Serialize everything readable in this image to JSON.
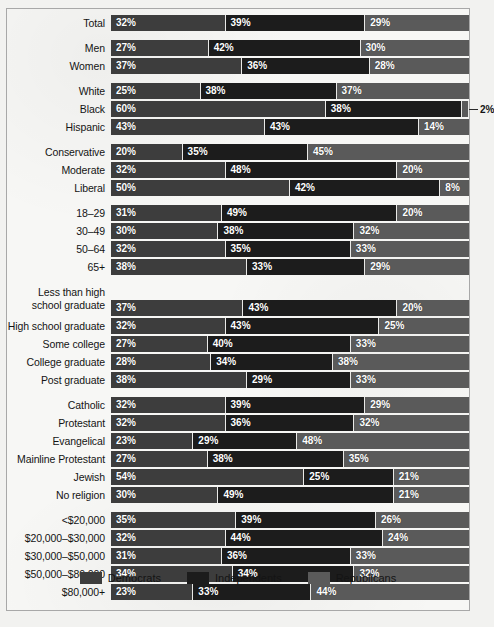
{
  "chart_data": {
    "type": "bar",
    "title": "",
    "subtitle": "",
    "xlabel": "",
    "ylabel": "",
    "orientation": "horizontal",
    "stacked": true,
    "normalized_percent": true,
    "xlim": [
      0,
      100
    ],
    "grid": false,
    "legend_position": "bottom",
    "series": [
      {
        "name": "Democrats",
        "color": "#3d3d3d"
      },
      {
        "name": "Independents",
        "color": "#1c1c1c"
      },
      {
        "name": "Republicans",
        "color": "#5a5a5a"
      }
    ],
    "categories": [
      "Total",
      "Men",
      "Women",
      "White",
      "Black",
      "Hispanic",
      "Conservative",
      "Moderate",
      "Liberal",
      "18–29",
      "30–49",
      "50–64",
      "65+",
      "Less than high school graduate",
      "High school graduate",
      "Some college",
      "College graduate",
      "Post graduate",
      "Catholic",
      "Protestant",
      "Evangelical",
      "Mainline Protestant",
      "Jewish",
      "No religion",
      "<$20,000",
      "$20,000–$30,000",
      "$30,000–$50,000",
      "$50,000–$80,000",
      "$80,000+"
    ],
    "groups": [
      {
        "name": "total",
        "rows": [
          {
            "label": "Total",
            "values": [
              32,
              39,
              29
            ],
            "labels": [
              "32%",
              "39%",
              "29%"
            ]
          }
        ]
      },
      {
        "name": "gender",
        "rows": [
          {
            "label": "Men",
            "values": [
              27,
              42,
              30
            ],
            "labels": [
              "27%",
              "42%",
              "30%"
            ]
          },
          {
            "label": "Women",
            "values": [
              37,
              36,
              28
            ],
            "labels": [
              "37%",
              "36%",
              "28%"
            ]
          }
        ]
      },
      {
        "name": "race",
        "rows": [
          {
            "label": "White",
            "values": [
              25,
              38,
              37
            ],
            "labels": [
              "25%",
              "38%",
              "37%"
            ]
          },
          {
            "label": "Black",
            "values": [
              60,
              38,
              2
            ],
            "labels": [
              "60%",
              "38%",
              "2%"
            ],
            "outside_last": true
          },
          {
            "label": "Hispanic",
            "values": [
              43,
              43,
              14
            ],
            "labels": [
              "43%",
              "43%",
              "14%"
            ]
          }
        ]
      },
      {
        "name": "ideology",
        "rows": [
          {
            "label": "Conservative",
            "values": [
              20,
              35,
              45
            ],
            "labels": [
              "20%",
              "35%",
              "45%"
            ]
          },
          {
            "label": "Moderate",
            "values": [
              32,
              48,
              20
            ],
            "labels": [
              "32%",
              "48%",
              "20%"
            ]
          },
          {
            "label": "Liberal",
            "values": [
              50,
              42,
              8
            ],
            "labels": [
              "50%",
              "42%",
              "8%"
            ]
          }
        ]
      },
      {
        "name": "age",
        "rows": [
          {
            "label": "18–29",
            "values": [
              31,
              49,
              20
            ],
            "labels": [
              "31%",
              "49%",
              "20%"
            ]
          },
          {
            "label": "30–49",
            "values": [
              30,
              38,
              32
            ],
            "labels": [
              "30%",
              "38%",
              "32%"
            ]
          },
          {
            "label": "50–64",
            "values": [
              32,
              35,
              33
            ],
            "labels": [
              "32%",
              "35%",
              "33%"
            ]
          },
          {
            "label": "65+",
            "values": [
              38,
              33,
              29
            ],
            "labels": [
              "38%",
              "33%",
              "29%"
            ]
          }
        ]
      },
      {
        "name": "education",
        "rows": [
          {
            "label": "Less than high\nschool graduate",
            "two_line": true,
            "values": [
              37,
              43,
              20
            ],
            "labels": [
              "37%",
              "43%",
              "20%"
            ]
          },
          {
            "label": "High school graduate",
            "values": [
              32,
              43,
              25
            ],
            "labels": [
              "32%",
              "43%",
              "25%"
            ]
          },
          {
            "label": "Some college",
            "values": [
              27,
              40,
              33
            ],
            "labels": [
              "27%",
              "40%",
              "33%"
            ]
          },
          {
            "label": "College graduate",
            "values": [
              28,
              34,
              38
            ],
            "labels": [
              "28%",
              "34%",
              "38%"
            ]
          },
          {
            "label": "Post graduate",
            "values": [
              38,
              29,
              33
            ],
            "labels": [
              "38%",
              "29%",
              "33%"
            ]
          }
        ]
      },
      {
        "name": "religion",
        "rows": [
          {
            "label": "Catholic",
            "values": [
              32,
              39,
              29
            ],
            "labels": [
              "32%",
              "39%",
              "29%"
            ]
          },
          {
            "label": "Protestant",
            "values": [
              32,
              36,
              32
            ],
            "labels": [
              "32%",
              "36%",
              "32%"
            ]
          },
          {
            "label": "Evangelical",
            "values": [
              23,
              29,
              48
            ],
            "labels": [
              "23%",
              "29%",
              "48%"
            ]
          },
          {
            "label": "Mainline Protestant",
            "values": [
              27,
              38,
              35
            ],
            "labels": [
              "27%",
              "38%",
              "35%"
            ]
          },
          {
            "label": "Jewish",
            "values": [
              54,
              25,
              21
            ],
            "labels": [
              "54%",
              "25%",
              "21%"
            ]
          },
          {
            "label": "No religion",
            "values": [
              30,
              49,
              21
            ],
            "labels": [
              "30%",
              "49%",
              "21%"
            ]
          }
        ]
      },
      {
        "name": "income",
        "rows": [
          {
            "label": "<$20,000",
            "values": [
              35,
              39,
              26
            ],
            "labels": [
              "35%",
              "39%",
              "26%"
            ]
          },
          {
            "label": "$20,000–$30,000",
            "values": [
              32,
              44,
              24
            ],
            "labels": [
              "32%",
              "44%",
              "24%"
            ]
          },
          {
            "label": "$30,000–$50,000",
            "values": [
              31,
              36,
              33
            ],
            "labels": [
              "31%",
              "36%",
              "33%"
            ]
          },
          {
            "label": "$50,000–$80,000",
            "values": [
              34,
              34,
              32
            ],
            "labels": [
              "34%",
              "34%",
              "32%"
            ]
          },
          {
            "label": "$80,000+",
            "values": [
              23,
              33,
              44
            ],
            "labels": [
              "23%",
              "33%",
              "44%"
            ]
          }
        ]
      }
    ],
    "legend": [
      {
        "label": "Democrats",
        "color": "#3d3d3d"
      },
      {
        "label": "Independents",
        "color": "#1c1c1c"
      },
      {
        "label": "Republicans",
        "color": "#5a5a5a"
      }
    ]
  }
}
